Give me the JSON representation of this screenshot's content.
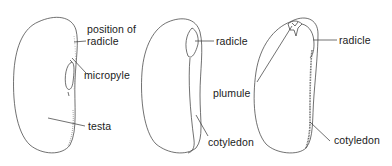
{
  "diagram": {
    "panels": [
      {
        "id": "external",
        "labels": {
          "position_of": "position of",
          "radicle": "radicle",
          "micropyle": "micropyle",
          "testa": "testa"
        }
      },
      {
        "id": "testa-removed",
        "labels": {
          "radicle": "radicle",
          "cotyledon": "cotyledon"
        }
      },
      {
        "id": "cotyledon-removed",
        "labels": {
          "radicle": "radicle",
          "plumule": "plumule",
          "cotyledon": "cotyledon"
        }
      }
    ],
    "colors": {
      "line": "#333333",
      "text": "#1a1a1a",
      "background": "#ffffff"
    }
  }
}
